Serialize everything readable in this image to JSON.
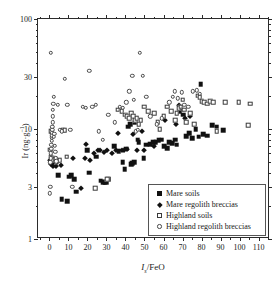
{
  "chart_data": {
    "type": "scatter",
    "title": "",
    "xlabel": "Is/FeO",
    "ylabel": "Ir (ng g-1)",
    "xlim": [
      -6,
      116
    ],
    "ylim": [
      1,
      100
    ],
    "yscale": "log",
    "xticks": [
      0,
      10,
      20,
      30,
      40,
      50,
      60,
      70,
      80,
      90,
      100,
      110
    ],
    "xticklabels": [
      "0",
      "10",
      "20",
      "30",
      "40",
      "50",
      "60",
      "70",
      "80",
      "90",
      "100",
      "110"
    ],
    "yticks": [
      1,
      3,
      10,
      30,
      100
    ],
    "yticklabels": [
      "1",
      "3",
      "10",
      "30",
      "100"
    ],
    "grid": false,
    "legend_position": "lower right",
    "series": [
      {
        "name": "Mare soils",
        "marker": "filled-square",
        "color": "#111111",
        "points": [
          [
            4.5,
            3.8
          ],
          [
            6.5,
            2.3
          ],
          [
            9.5,
            2.2
          ],
          [
            10.5,
            3.7
          ],
          [
            11.5,
            3.8
          ],
          [
            13.0,
            3.5
          ],
          [
            14.0,
            2.7
          ],
          [
            20.0,
            6.4
          ],
          [
            21.0,
            4.0
          ],
          [
            24.5,
            5.6
          ],
          [
            27.0,
            3.4
          ],
          [
            28.0,
            3.3
          ],
          [
            29.0,
            3.3
          ],
          [
            30.0,
            3.3
          ],
          [
            31.0,
            3.5
          ],
          [
            34.0,
            7.0
          ],
          [
            36.5,
            6.3
          ],
          [
            38.5,
            5.0
          ],
          [
            39.5,
            4.3
          ],
          [
            40.5,
            6.6
          ],
          [
            41.5,
            10.5
          ],
          [
            42.5,
            11.0
          ],
          [
            43.0,
            4.8
          ],
          [
            43.5,
            4.9
          ],
          [
            44.5,
            5.0
          ],
          [
            45.0,
            11.5
          ],
          [
            46.5,
            8.0
          ],
          [
            47.0,
            7.6
          ],
          [
            49.5,
            5.4
          ],
          [
            51.0,
            7.2
          ],
          [
            53.0,
            7.3
          ],
          [
            54.5,
            7.6
          ],
          [
            56.0,
            7.6
          ],
          [
            57.5,
            7.9
          ],
          [
            59.0,
            8.0
          ],
          [
            60.5,
            7.0
          ],
          [
            62.0,
            6.7
          ],
          [
            63.0,
            7.6
          ],
          [
            64.5,
            7.4
          ],
          [
            66.0,
            8.0
          ],
          [
            67.0,
            7.2
          ],
          [
            68.5,
            14.5
          ],
          [
            69.5,
            15.0
          ],
          [
            70.5,
            13.5
          ],
          [
            72.0,
            8.6
          ],
          [
            73.5,
            9.2
          ],
          [
            75.0,
            8.2
          ],
          [
            77.0,
            10.0
          ],
          [
            78.5,
            8.5
          ],
          [
            79.5,
            25.5
          ],
          [
            81.0,
            9.0
          ],
          [
            83.0,
            8.7
          ],
          [
            85.5,
            10.8
          ],
          [
            88.0,
            10.5
          ],
          [
            91.5,
            9.8
          ]
        ]
      },
      {
        "name": "Mare regolith breccias",
        "marker": "filled-diamond",
        "color": "#111111",
        "points": [
          [
            0.5,
            5.2
          ],
          [
            0.8,
            5.0
          ],
          [
            1.0,
            4.8
          ],
          [
            1.2,
            5.4
          ],
          [
            1.5,
            5.6
          ],
          [
            2.0,
            4.6
          ],
          [
            2.5,
            5.0
          ],
          [
            3.5,
            4.6
          ],
          [
            4.0,
            5.0
          ],
          [
            6.0,
            4.7
          ],
          [
            12.5,
            5.5
          ],
          [
            16.5,
            2.9
          ],
          [
            18.5,
            5.4
          ],
          [
            19.5,
            7.3
          ],
          [
            21.5,
            5.2
          ],
          [
            23.5,
            6.0
          ],
          [
            25.5,
            6.5
          ],
          [
            26.5,
            6.4
          ],
          [
            28.5,
            6.2
          ],
          [
            30.5,
            6.4
          ],
          [
            33.0,
            6.0
          ],
          [
            35.0,
            6.5
          ],
          [
            36.0,
            9.2
          ],
          [
            38.0,
            6.4
          ],
          [
            39.0,
            6.5
          ],
          [
            41.0,
            6.6
          ],
          [
            44.0,
            9.0
          ],
          [
            46.0,
            6.5
          ],
          [
            48.5,
            9.5
          ],
          [
            50.0,
            6.4
          ],
          [
            55.0,
            7.0
          ],
          [
            61.0,
            12.0
          ],
          [
            66.5,
            11.0
          ],
          [
            68.0,
            16.5
          ],
          [
            71.5,
            12.5
          ],
          [
            74.0,
            13.0
          ]
        ]
      },
      {
        "name": "Highland soils",
        "marker": "open-square",
        "color": "#3a3a3a",
        "points": [
          [
            0.3,
            6.5
          ],
          [
            0.6,
            5.6
          ],
          [
            1.0,
            9.6
          ],
          [
            1.4,
            5.5
          ],
          [
            2.0,
            5.2
          ],
          [
            3.0,
            5.3
          ],
          [
            5.5,
            5.2
          ],
          [
            7.0,
            9.8
          ],
          [
            8.0,
            9.7
          ],
          [
            9.0,
            5.6
          ],
          [
            24.0,
            2.9
          ],
          [
            30.5,
            3.5
          ],
          [
            36.0,
            15.0
          ],
          [
            38.0,
            14.5
          ],
          [
            40.0,
            13.5
          ],
          [
            41.0,
            13.0
          ],
          [
            42.0,
            12.5
          ],
          [
            43.0,
            14.0
          ],
          [
            44.0,
            13.0
          ],
          [
            45.0,
            12.0
          ],
          [
            46.0,
            12.5
          ],
          [
            47.0,
            11.0
          ],
          [
            48.0,
            12.0
          ],
          [
            50.0,
            16.0
          ],
          [
            52.0,
            14.5
          ],
          [
            55.0,
            14.0
          ],
          [
            57.0,
            11.5
          ],
          [
            58.0,
            10.0
          ],
          [
            60.0,
            13.0
          ],
          [
            62.0,
            16.0
          ],
          [
            64.0,
            14.5
          ],
          [
            66.0,
            12.0
          ],
          [
            67.0,
            14.0
          ],
          [
            68.0,
            15.5
          ],
          [
            69.0,
            16.0
          ],
          [
            70.0,
            18.5
          ],
          [
            71.0,
            15.0
          ],
          [
            72.0,
            11.5
          ],
          [
            74.0,
            14.0
          ],
          [
            76.0,
            11.0
          ],
          [
            78.0,
            20.0
          ],
          [
            79.0,
            19.5
          ],
          [
            80.0,
            18.0
          ],
          [
            81.5,
            17.5
          ],
          [
            83.0,
            17.0
          ],
          [
            84.5,
            18.0
          ],
          [
            86.0,
            17.5
          ],
          [
            88.0,
            9.5
          ],
          [
            92.5,
            17.5
          ],
          [
            99.5,
            17.5
          ],
          [
            104.5,
            10.8
          ],
          [
            105.5,
            17.0
          ]
        ]
      },
      {
        "name": "Highland regolith breccias",
        "marker": "open-circle",
        "color": "#4a4a4a",
        "points": [
          [
            0.2,
            2.6
          ],
          [
            0.4,
            3.0
          ],
          [
            0.5,
            5.0
          ],
          [
            0.6,
            5.4
          ],
          [
            0.8,
            6.0
          ],
          [
            0.9,
            6.6
          ],
          [
            1.0,
            7.2
          ],
          [
            1.1,
            7.8
          ],
          [
            1.2,
            8.4
          ],
          [
            1.3,
            8.8
          ],
          [
            1.4,
            9.2
          ],
          [
            1.5,
            9.8
          ],
          [
            1.6,
            10.5
          ],
          [
            1.7,
            11.5
          ],
          [
            1.8,
            13.0
          ],
          [
            1.9,
            15.0
          ],
          [
            2.0,
            17.0
          ],
          [
            2.2,
            19.5
          ],
          [
            2.4,
            8.5
          ],
          [
            2.6,
            9.0
          ],
          [
            2.8,
            7.0
          ],
          [
            3.0,
            6.2
          ],
          [
            3.2,
            5.4
          ],
          [
            3.4,
            4.9
          ],
          [
            3.6,
            5.1
          ],
          [
            0.7,
            49.0
          ],
          [
            4.5,
            16.5
          ],
          [
            5.5,
            9.8
          ],
          [
            6.5,
            9.5
          ],
          [
            8.0,
            28.5
          ],
          [
            9.5,
            16.5
          ],
          [
            11.0,
            9.8
          ],
          [
            12.0,
            3.0
          ],
          [
            17.5,
            16.0
          ],
          [
            19.0,
            15.5
          ],
          [
            21.0,
            34.0
          ],
          [
            22.5,
            16.0
          ],
          [
            24.5,
            16.5
          ],
          [
            26.0,
            9.5
          ],
          [
            28.0,
            8.0
          ],
          [
            31.0,
            13.5
          ],
          [
            34.5,
            11.5
          ],
          [
            37.0,
            16.0
          ],
          [
            38.5,
            15.5
          ],
          [
            40.5,
            17.5
          ],
          [
            42.0,
            22.0
          ],
          [
            43.5,
            30.5
          ],
          [
            44.5,
            18.5
          ],
          [
            45.5,
            9.5
          ],
          [
            46.5,
            9.8
          ],
          [
            47.5,
            49.0
          ],
          [
            49.0,
            30.5
          ],
          [
            51.0,
            19.5
          ],
          [
            53.0,
            13.0
          ],
          [
            56.5,
            11.0
          ],
          [
            59.0,
            12.5
          ],
          [
            63.0,
            17.5
          ],
          [
            65.0,
            19.5
          ],
          [
            66.0,
            22.0
          ],
          [
            67.5,
            19.0
          ],
          [
            69.5,
            21.5
          ],
          [
            71.0,
            16.5
          ],
          [
            73.0,
            16.0
          ],
          [
            75.5,
            22.0
          ],
          [
            77.5,
            22.5
          ],
          [
            79.0,
            21.0
          ]
        ]
      }
    ]
  },
  "legend": {
    "entries": [
      {
        "label": "Mare soils",
        "symbol": "filled-square"
      },
      {
        "label": "Mare regolith breccias",
        "symbol": "filled-diamond"
      },
      {
        "label": "Highland soils",
        "symbol": "open-square"
      },
      {
        "label": "Highland regolith breccias",
        "symbol": "open-circle"
      }
    ]
  }
}
